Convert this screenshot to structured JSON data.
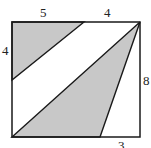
{
  "diagram": {
    "type": "geometry-figure",
    "labels": {
      "top_left_segment": "5",
      "top_right_segment": "4",
      "left_segment": "4",
      "right_side": "8",
      "bottom_right_segment": "3"
    },
    "colors": {
      "shade": "#c8c8c8",
      "stroke": "#1a1a1a",
      "background": "#ffffff"
    },
    "shapes": [
      {
        "name": "rectangle",
        "points": [
          [
            12,
            22
          ],
          [
            140,
            22
          ],
          [
            140,
            137
          ],
          [
            12,
            137
          ]
        ]
      },
      {
        "name": "top-left-triangle",
        "points": [
          [
            12,
            22
          ],
          [
            84,
            22
          ],
          [
            12,
            80
          ]
        ],
        "shaded": true
      },
      {
        "name": "large-triangle",
        "points": [
          [
            12,
            137
          ],
          [
            140,
            22
          ],
          [
            100,
            137
          ]
        ],
        "shaded": true
      }
    ]
  }
}
